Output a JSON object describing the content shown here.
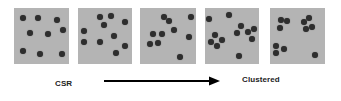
{
  "diagram": {
    "panel_color": "#b4b4b4",
    "dot_color": "#2e2e2e",
    "panels": [
      {
        "id": "panel-1",
        "x": 14,
        "y": 8,
        "w": 55,
        "h": 56,
        "dots": [
          [
            23,
            18
          ],
          [
            38,
            18
          ],
          [
            57,
            20
          ],
          [
            30,
            33
          ],
          [
            48,
            34
          ],
          [
            63,
            30
          ],
          [
            23,
            51
          ],
          [
            40,
            54
          ],
          [
            62,
            54
          ]
        ]
      },
      {
        "id": "panel-2",
        "x": 78,
        "y": 8,
        "w": 54,
        "h": 56,
        "dots": [
          [
            100,
            17
          ],
          [
            111,
            16
          ],
          [
            104,
            25
          ],
          [
            125,
            22
          ],
          [
            84,
            31
          ],
          [
            84,
            42
          ],
          [
            100,
            42
          ],
          [
            114,
            36
          ],
          [
            125,
            46
          ],
          [
            116,
            53
          ]
        ]
      },
      {
        "id": "panel-3",
        "x": 140,
        "y": 8,
        "w": 56,
        "h": 56,
        "dots": [
          [
            164,
            17
          ],
          [
            169,
            21
          ],
          [
            174,
            30
          ],
          [
            191,
            17
          ],
          [
            189,
            37
          ],
          [
            153,
            34
          ],
          [
            162,
            34
          ],
          [
            150,
            44
          ],
          [
            158,
            43
          ],
          [
            180,
            57
          ]
        ]
      },
      {
        "id": "panel-4",
        "x": 205,
        "y": 8,
        "w": 54,
        "h": 56,
        "dots": [
          [
            209,
            19
          ],
          [
            229,
            15
          ],
          [
            241,
            26
          ],
          [
            248,
            32
          ],
          [
            237,
            33
          ],
          [
            254,
            29
          ],
          [
            252,
            39
          ],
          [
            215,
            35
          ],
          [
            211,
            42
          ],
          [
            222,
            40
          ],
          [
            217,
            46
          ],
          [
            239,
            56
          ]
        ]
      },
      {
        "id": "panel-5",
        "x": 270,
        "y": 8,
        "w": 55,
        "h": 56,
        "dots": [
          [
            281,
            20
          ],
          [
            287,
            21
          ],
          [
            280,
            28
          ],
          [
            304,
            22
          ],
          [
            309,
            18
          ],
          [
            312,
            27
          ],
          [
            306,
            29
          ],
          [
            276,
            46
          ],
          [
            284,
            49
          ],
          [
            276,
            53
          ],
          [
            315,
            55
          ]
        ]
      }
    ],
    "arrow": {
      "x1": 104,
      "x2": 220,
      "y": 81,
      "color": "#000000"
    },
    "labels": {
      "left": "CSR",
      "right": "Clustered"
    }
  }
}
